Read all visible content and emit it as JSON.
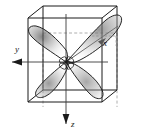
{
  "figure": {
    "type": "orbital-diagram",
    "background_color": "#ffffff",
    "line_color": "#1a1a1a",
    "shade_color": "#8a8a8a",
    "dash_color": "#9a9a9a"
  },
  "axes": {
    "left": {
      "label": "y",
      "direction": "left",
      "arrow": true
    },
    "diagonal": {
      "label": "x",
      "direction": "lower-left-into-page",
      "arrow": true
    },
    "bottom": {
      "label": "z",
      "direction": "down",
      "arrow": true
    }
  },
  "cube": {
    "name": "reference-cube",
    "visible_edges": 9,
    "hidden_edges_dashed": 3
  },
  "orbital": {
    "lobes": 4,
    "nucleus": "center-node",
    "lobe_names": [
      "upper-left-lobe",
      "upper-right-lobe",
      "lower-left-lobe",
      "lower-right-lobe"
    ]
  }
}
